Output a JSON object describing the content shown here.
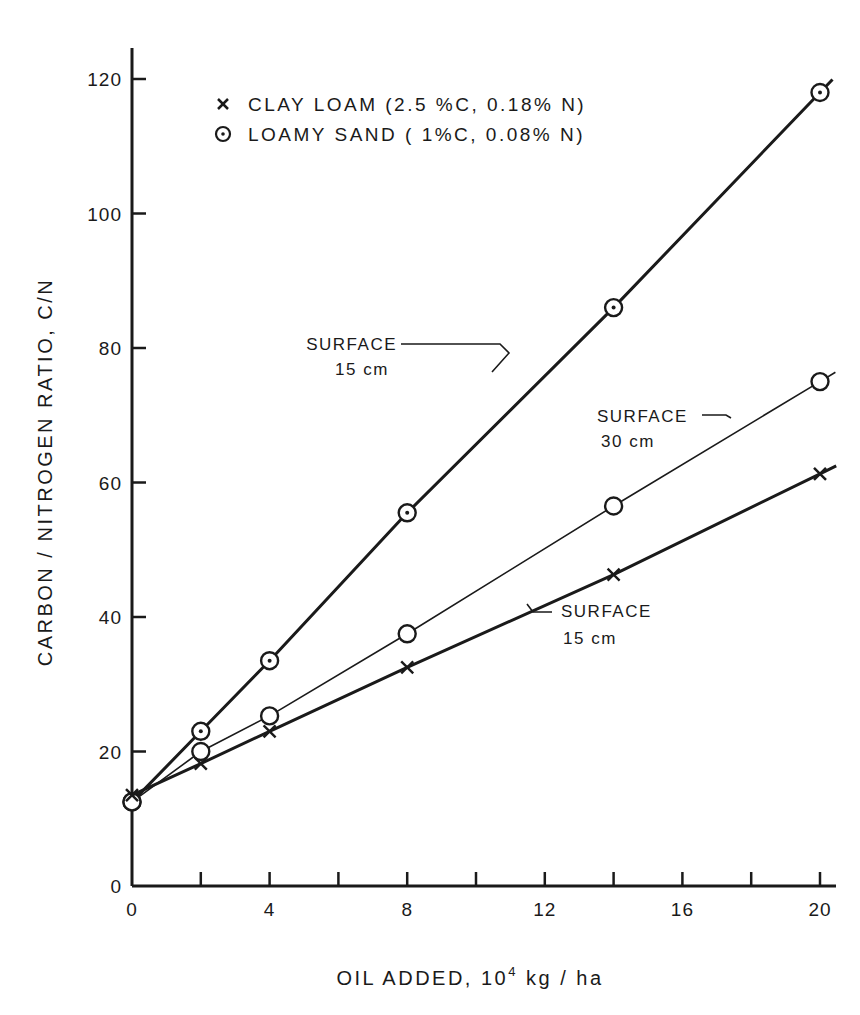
{
  "chart_data": {
    "type": "line",
    "title": "",
    "xlabel": "OIL ADDED, 10^4 kg / ha",
    "xlabel_parts": {
      "main": "OIL ADDED,  10",
      "sup": "4",
      "unit": " kg / ha"
    },
    "ylabel": "CARBON / NITROGEN RATIO, C/N",
    "xlim": [
      0,
      20
    ],
    "ylim": [
      0,
      120
    ],
    "x_ticks_major": [
      0,
      4,
      8,
      12,
      16,
      20
    ],
    "x_ticks_minor": [
      2,
      6,
      10,
      14,
      18
    ],
    "y_ticks": [
      0,
      20,
      40,
      60,
      80,
      100,
      120
    ],
    "grid": false,
    "legend_position": "upper-left inside",
    "legend": [
      {
        "marker": "x",
        "label": "CLAY LOAM  (2.5 %C, 0.18% N)"
      },
      {
        "marker": "dotted-circle",
        "label": "LOAMY SAND ( 1%C, 0.08% N)"
      }
    ],
    "series": [
      {
        "name": "Loamy sand, surface 15 cm",
        "soil": "LOAMY SAND",
        "depth": "15 cm",
        "marker": "dotted-circle",
        "line_weight": "heavy",
        "x": [
          0,
          2,
          4,
          8,
          14,
          20
        ],
        "values": [
          12.5,
          23,
          33.5,
          55.5,
          86,
          118
        ]
      },
      {
        "name": "Loamy sand, surface 30 cm",
        "soil": "LOAMY SAND",
        "depth": "30 cm",
        "marker": "open-circle",
        "line_weight": "light",
        "x": [
          0,
          2,
          4,
          8,
          14,
          20
        ],
        "values": [
          12.5,
          20,
          25.3,
          37.5,
          56.5,
          75
        ]
      },
      {
        "name": "Clay loam, surface 15 cm",
        "soil": "CLAY LOAM",
        "depth": "15 cm",
        "marker": "x",
        "line_weight": "heavy",
        "x": [
          0,
          2,
          4,
          8,
          14,
          20
        ],
        "values": [
          13.5,
          18.2,
          23,
          32.5,
          46.3,
          61.3
        ]
      }
    ],
    "annotations": [
      {
        "line1": "SURFACE",
        "line2": "15 cm",
        "target": "Loamy sand, surface 15 cm"
      },
      {
        "line1": "SURFACE",
        "line2": "30 cm",
        "target": "Loamy sand, surface 30 cm"
      },
      {
        "line1": "SURFACE",
        "line2": "15 cm",
        "target": "Clay loam, surface 15 cm"
      }
    ]
  },
  "colors": {
    "ink": "#1a1a1a",
    "background": "#ffffff"
  }
}
